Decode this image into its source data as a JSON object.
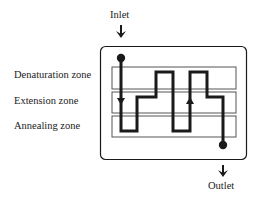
{
  "diagram": {
    "inlet_label": "Inlet",
    "outlet_label": "Outlet",
    "zones": [
      {
        "label": "Denaturation zone"
      },
      {
        "label": "Extension zone"
      },
      {
        "label": "Annealing zone"
      }
    ],
    "colors": {
      "stroke": "#1a1a1a",
      "background": "#ffffff"
    }
  }
}
